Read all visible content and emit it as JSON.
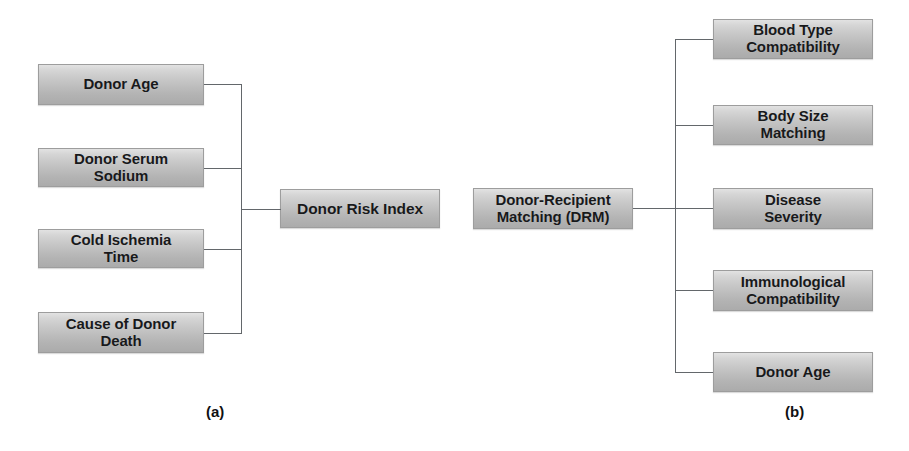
{
  "figure": {
    "background_color": "#ffffff",
    "node_fill_top": "#e2e2e2",
    "node_fill_bottom": "#ababab",
    "node_border_color": "#9d9d9d",
    "connector_color": "#63676b",
    "text_color": "#18191b"
  },
  "panel_a": {
    "caption": "(a)",
    "hub": {
      "label": "Donor Risk Index"
    },
    "factors": [
      {
        "label": "Donor Age"
      },
      {
        "label": "Donor Serum\nSodium"
      },
      {
        "label": "Cold Ischemia\nTime"
      },
      {
        "label": "Cause of Donor\nDeath"
      }
    ]
  },
  "panel_b": {
    "caption": "(b)",
    "hub": {
      "label": "Donor-Recipient\nMatching (DRM)"
    },
    "factors": [
      {
        "label": "Blood Type\nCompatibility"
      },
      {
        "label": "Body Size\nMatching"
      },
      {
        "label": "Disease\nSeverity"
      },
      {
        "label": "Immunological\nCompatibility"
      },
      {
        "label": "Donor Age"
      }
    ]
  }
}
